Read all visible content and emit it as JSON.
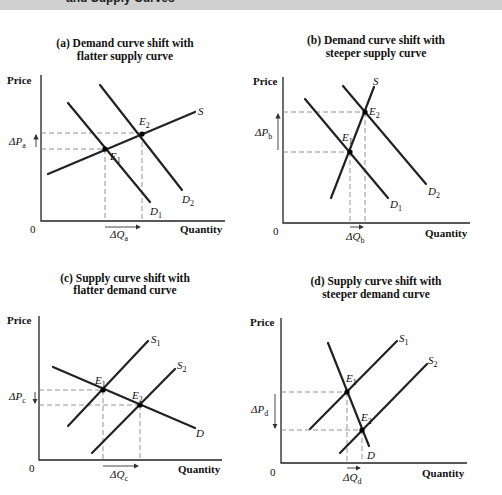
{
  "header": {
    "text": "and Supply Curves"
  },
  "panels": [
    {
      "id": "a",
      "title_line1": "(a) Demand curve shift with",
      "title_line2": "flatter supply curve",
      "y_axis_label": "Price",
      "x_axis_label": "Quantity",
      "origin_label": "0",
      "delta_p": {
        "base": "ΔP",
        "sub": "a",
        "direction": "up"
      },
      "delta_q": {
        "base": "ΔQ",
        "sub": "a",
        "direction": "right"
      },
      "curves": [
        {
          "label": "S",
          "sub": ""
        },
        {
          "label": "D",
          "sub": "1"
        },
        {
          "label": "D",
          "sub": "2"
        }
      ],
      "points": [
        {
          "label": "E",
          "sub": "1"
        },
        {
          "label": "E",
          "sub": "2"
        }
      ]
    },
    {
      "id": "b",
      "title_line1": "(b) Demand curve shift with",
      "title_line2": "steeper supply curve",
      "y_axis_label": "Price",
      "x_axis_label": "Quantity",
      "origin_label": "0",
      "delta_p": {
        "base": "ΔP",
        "sub": "b",
        "direction": "up"
      },
      "delta_q": {
        "base": "ΔQ",
        "sub": "b",
        "direction": "right"
      },
      "curves": [
        {
          "label": "S",
          "sub": ""
        },
        {
          "label": "D",
          "sub": "1"
        },
        {
          "label": "D",
          "sub": "2"
        }
      ],
      "points": [
        {
          "label": "E",
          "sub": "1"
        },
        {
          "label": "E",
          "sub": "2"
        }
      ]
    },
    {
      "id": "c",
      "title_line1": "(c) Supply curve shift with",
      "title_line2": "flatter demand curve",
      "y_axis_label": "Price",
      "x_axis_label": "Quantity",
      "origin_label": "0",
      "delta_p": {
        "base": "ΔP",
        "sub": "c",
        "direction": "down"
      },
      "delta_q": {
        "base": "ΔQ",
        "sub": "c",
        "direction": "right"
      },
      "curves": [
        {
          "label": "S",
          "sub": "1"
        },
        {
          "label": "S",
          "sub": "2"
        },
        {
          "label": "D",
          "sub": ""
        }
      ],
      "points": [
        {
          "label": "E",
          "sub": "1"
        },
        {
          "label": "E",
          "sub": "2"
        }
      ]
    },
    {
      "id": "d",
      "title_line1": "(d) Supply curve shift with",
      "title_line2": "steeper demand curve",
      "y_axis_label": "Price",
      "x_axis_label": "Quantity",
      "origin_label": "0",
      "delta_p": {
        "base": "ΔP",
        "sub": "d",
        "direction": "down"
      },
      "delta_q": {
        "base": "ΔQ",
        "sub": "d",
        "direction": "right"
      },
      "curves": [
        {
          "label": "S",
          "sub": "1"
        },
        {
          "label": "S",
          "sub": "2"
        },
        {
          "label": "D",
          "sub": ""
        }
      ],
      "points": [
        {
          "label": "E",
          "sub": "1"
        },
        {
          "label": "E",
          "sub": "2"
        }
      ]
    }
  ]
}
